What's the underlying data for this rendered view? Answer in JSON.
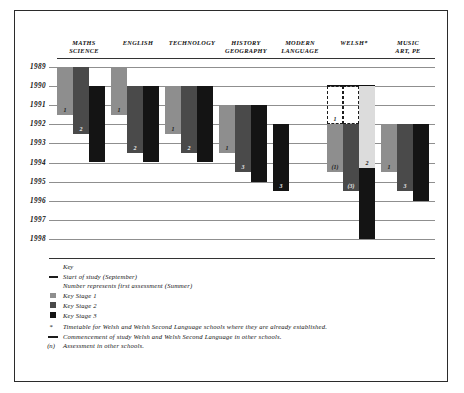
{
  "chart_data": {
    "type": "bar",
    "title": "",
    "orientation": "vertical-timeline",
    "xlabel": "",
    "ylabel": "",
    "ylim": [
      1989,
      1998
    ],
    "grid": true,
    "years": [
      "1989",
      "1990",
      "1991",
      "1992",
      "1993",
      "1994",
      "1995",
      "1996",
      "1997",
      "1998"
    ],
    "categories": [
      "MATHS SCIENCE",
      "ENGLISH",
      "TECHNOLOGY",
      "HISTORY GEOGRAPHY",
      "MODERN LANGUAGE",
      "WELSH*",
      "MUSIC ART, PE"
    ],
    "series": [
      {
        "name": "Key Stage 1",
        "color": "#8e8e8e"
      },
      {
        "name": "Key Stage 2",
        "color": "#4a4a4a"
      },
      {
        "name": "Key Stage 3",
        "color": "#141414"
      }
    ],
    "columns": [
      {
        "label_line1": "MATHS",
        "label_line2": "SCIENCE",
        "bars": [
          {
            "stage": "ks1",
            "start": 1989,
            "end": 1991.5,
            "label": "1"
          },
          {
            "stage": "ks2",
            "start": 1989,
            "end": 1992.5,
            "label": "2"
          },
          {
            "stage": "ks3",
            "start": 1990,
            "end": 1994.0,
            "label": ""
          }
        ]
      },
      {
        "label_line1": "ENGLISH",
        "label_line2": "",
        "bars": [
          {
            "stage": "ks1",
            "start": 1989,
            "end": 1991.5,
            "label": "1"
          },
          {
            "stage": "ks2",
            "start": 1990,
            "end": 1993.5,
            "label": "2"
          },
          {
            "stage": "ks3",
            "start": 1990,
            "end": 1994.0,
            "label": ""
          }
        ]
      },
      {
        "label_line1": "TECHNOLOGY",
        "label_line2": "",
        "bars": [
          {
            "stage": "ks1",
            "start": 1990,
            "end": 1992.5,
            "label": "1"
          },
          {
            "stage": "ks2",
            "start": 1990,
            "end": 1993.5,
            "label": "2"
          },
          {
            "stage": "ks3",
            "start": 1990,
            "end": 1994.0,
            "label": ""
          }
        ]
      },
      {
        "label_line1": "HISTORY",
        "label_line2": "GEOGRAPHY",
        "bars": [
          {
            "stage": "ks1",
            "start": 1991,
            "end": 1993.5,
            "label": "1"
          },
          {
            "stage": "ks2",
            "start": 1991,
            "end": 1994.5,
            "label": "3"
          },
          {
            "stage": "ks3",
            "start": 1991,
            "end": 1995.0,
            "label": ""
          }
        ]
      },
      {
        "label_line1": "MODERN",
        "label_line2": "LANGUAGE",
        "bars": [
          {
            "stage": "ks3",
            "start": 1992,
            "end": 1995.5,
            "label": "3"
          }
        ]
      },
      {
        "label_line1": "WELSH*",
        "label_line2": "",
        "bars": [
          {
            "stage": "ks1",
            "start": 1992,
            "end": 1994.5,
            "label": "(1)"
          },
          {
            "stage": "ks2",
            "start": 1992,
            "end": 1995.5,
            "label": "(3)"
          },
          {
            "stage": "pale",
            "start": 1990,
            "end": 1994.3,
            "label": "2"
          },
          {
            "stage": "ks3",
            "start": 1994.3,
            "end": 1998.0,
            "label": ""
          }
        ],
        "dashed_bars": [
          {
            "start": 1990,
            "end": 1992,
            "label": "1"
          },
          {
            "start": 1990,
            "end": 1992,
            "label": ""
          }
        ],
        "has_cap": true
      },
      {
        "label_line1": "MUSIC",
        "label_line2": "ART, PE",
        "bars": [
          {
            "stage": "ks1",
            "start": 1992,
            "end": 1994.5,
            "label": "1"
          },
          {
            "stage": "ks2",
            "start": 1992,
            "end": 1995.5,
            "label": "3"
          },
          {
            "stage": "ks3",
            "start": 1992,
            "end": 1996.0,
            "label": ""
          }
        ]
      }
    ],
    "annotations": [
      "Number represents first assessment (Summer)",
      "Start of study (September)"
    ]
  },
  "key": {
    "title": "Key",
    "items": [
      {
        "marker": "line",
        "label": "Start of study (September)"
      },
      {
        "marker": "none",
        "label": "Number represents first assessment (Summer)"
      },
      {
        "marker": "ks1",
        "label": "Key Stage 1"
      },
      {
        "marker": "ks2",
        "label": "Key Stage 2"
      },
      {
        "marker": "ks3",
        "label": "Key Stage 3"
      },
      {
        "marker": "star",
        "label": "Timetable for Welsh and Welsh Second Language schools where they are already established."
      },
      {
        "marker": "dash",
        "label": "Commencement of study Welsh and Welsh Second Language in other schools."
      },
      {
        "marker": "paren",
        "label": "Assessment in other schools."
      }
    ],
    "marker_glyphs": {
      "star": "*",
      "paren": "(n)"
    }
  }
}
